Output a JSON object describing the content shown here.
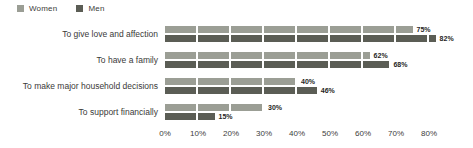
{
  "legend": {
    "items": [
      {
        "label": "Women",
        "color": "#9b9e95"
      },
      {
        "label": "Men",
        "color": "#5b5d55"
      }
    ]
  },
  "chart_data": {
    "type": "bar",
    "orientation": "horizontal",
    "title": "",
    "categories": [
      "To give love and affection",
      "To have a family",
      "To make major household decisions",
      "To support financially"
    ],
    "series": [
      {
        "name": "Women",
        "color": "#9b9e95",
        "values": [
          75,
          62,
          40,
          30
        ]
      },
      {
        "name": "Men",
        "color": "#5b5d55",
        "values": [
          82,
          68,
          46,
          15
        ]
      }
    ],
    "value_label_suffix": "%",
    "x_ticks": [
      "0%",
      "10%",
      "20%",
      "30%",
      "40%",
      "50%",
      "60%",
      "70%",
      "80%"
    ],
    "xlim": [
      0,
      80
    ],
    "grid": false,
    "legend_position": "top-left",
    "bar_segment_interval_pct": 10
  }
}
